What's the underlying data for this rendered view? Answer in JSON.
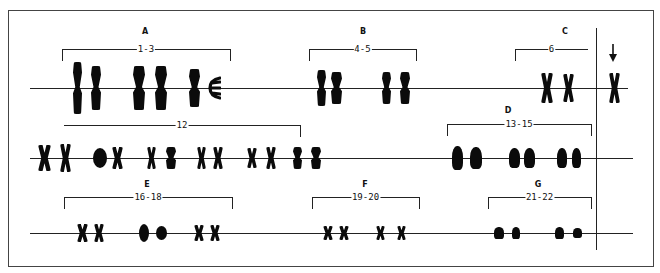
{
  "figure": {
    "type": "karyotype",
    "frame": {
      "left": 8,
      "top": 10,
      "right": 654,
      "bottom": 267
    },
    "divider": {
      "x": 596,
      "y1": 28,
      "y2": 250
    },
    "rows": [
      {
        "id": "row-1",
        "y": 88,
        "x1": 30,
        "x2": 628
      },
      {
        "id": "row-2",
        "y": 158,
        "x1": 30,
        "x2": 633
      },
      {
        "id": "row-3",
        "y": 233,
        "x1": 30,
        "x2": 633
      }
    ],
    "groups": [
      {
        "id": "A",
        "letter": "A",
        "range": "1-3",
        "letter_x": 145,
        "letter_y": 27,
        "bracket": {
          "x1": 62,
          "x2": 230,
          "y": 49,
          "tick": 12,
          "open": "both-down"
        },
        "row": 0,
        "chromosomes": [
          {
            "x": 73,
            "w": 9,
            "h": 52,
            "shape": "long"
          },
          {
            "x": 91,
            "w": 10,
            "h": 44,
            "shape": "long"
          },
          {
            "x": 133,
            "w": 12,
            "h": 44,
            "shape": "long"
          },
          {
            "x": 155,
            "w": 12,
            "h": 44,
            "shape": "long"
          },
          {
            "x": 189,
            "w": 11,
            "h": 38,
            "shape": "long"
          },
          {
            "x": 207,
            "w": 14,
            "h": 28,
            "shape": "fork"
          }
        ]
      },
      {
        "id": "B",
        "letter": "B",
        "range": "4-5",
        "letter_x": 363,
        "letter_y": 27,
        "bracket": {
          "x1": 309,
          "x2": 416,
          "y": 49,
          "tick": 12,
          "open": "both-down"
        },
        "row": 0,
        "chromosomes": [
          {
            "x": 317,
            "w": 9,
            "h": 36,
            "shape": "long"
          },
          {
            "x": 331,
            "w": 11,
            "h": 32,
            "shape": "long"
          },
          {
            "x": 382,
            "w": 9,
            "h": 32,
            "shape": "long"
          },
          {
            "x": 400,
            "w": 10,
            "h": 32,
            "shape": "long"
          }
        ]
      },
      {
        "id": "C",
        "letter": "C",
        "range": "6",
        "letter_x": 565,
        "letter_y": 27,
        "bracket": {
          "x1": 515,
          "x2": 588,
          "y": 49,
          "tick": 12,
          "open": "left-down"
        },
        "row": 0,
        "chromosomes": [
          {
            "x": 541,
            "w": 12,
            "h": 30,
            "shape": "x"
          },
          {
            "x": 563,
            "w": 11,
            "h": 28,
            "shape": "x"
          }
        ],
        "extra_row_2": [
          {
            "x": 38,
            "w": 13,
            "h": 26,
            "shape": "x"
          },
          {
            "x": 60,
            "w": 11,
            "h": 28,
            "shape": "x"
          },
          {
            "x": 93,
            "w": 14,
            "h": 20,
            "shape": "blob"
          },
          {
            "x": 112,
            "w": 11,
            "h": 22,
            "shape": "x"
          },
          {
            "x": 147,
            "w": 9,
            "h": 22,
            "shape": "x"
          },
          {
            "x": 166,
            "w": 10,
            "h": 22,
            "shape": "long"
          },
          {
            "x": 197,
            "w": 9,
            "h": 22,
            "shape": "x"
          },
          {
            "x": 213,
            "w": 10,
            "h": 22,
            "shape": "x"
          },
          {
            "x": 247,
            "w": 10,
            "h": 20,
            "shape": "x"
          },
          {
            "x": 266,
            "w": 10,
            "h": 22,
            "shape": "x"
          },
          {
            "x": 293,
            "w": 9,
            "h": 22,
            "shape": "long"
          },
          {
            "x": 311,
            "w": 10,
            "h": 22,
            "shape": "long"
          }
        ],
        "row2_bracket": {
          "x1": 64,
          "x2": 300,
          "y": 125,
          "label": "12",
          "open": "right-down"
        }
      },
      {
        "id": "D",
        "letter": "D",
        "range": "13-15",
        "letter_x": 508,
        "letter_y": 106,
        "bracket": {
          "x1": 447,
          "x2": 591,
          "y": 124,
          "tick": 12,
          "open": "both-down"
        },
        "row": 1,
        "chromosomes": [
          {
            "x": 452,
            "w": 11,
            "h": 24,
            "shape": "acro"
          },
          {
            "x": 470,
            "w": 12,
            "h": 22,
            "shape": "acro"
          },
          {
            "x": 509,
            "w": 11,
            "h": 20,
            "shape": "acro"
          },
          {
            "x": 524,
            "w": 11,
            "h": 20,
            "shape": "acro"
          },
          {
            "x": 557,
            "w": 10,
            "h": 20,
            "shape": "acro"
          },
          {
            "x": 572,
            "w": 9,
            "h": 20,
            "shape": "acro"
          }
        ]
      },
      {
        "id": "E",
        "letter": "E",
        "range": "16-18",
        "letter_x": 147,
        "letter_y": 180,
        "bracket": {
          "x1": 64,
          "x2": 232,
          "y": 197,
          "tick": 12,
          "open": "both-down"
        },
        "row": 2,
        "chromosomes": [
          {
            "x": 77,
            "w": 11,
            "h": 18,
            "shape": "x"
          },
          {
            "x": 94,
            "w": 10,
            "h": 18,
            "shape": "x"
          },
          {
            "x": 139,
            "w": 10,
            "h": 18,
            "shape": "blob"
          },
          {
            "x": 156,
            "w": 11,
            "h": 14,
            "shape": "blob"
          },
          {
            "x": 194,
            "w": 10,
            "h": 16,
            "shape": "x"
          },
          {
            "x": 210,
            "w": 10,
            "h": 16,
            "shape": "x"
          }
        ]
      },
      {
        "id": "F",
        "letter": "F",
        "range": "19-20",
        "letter_x": 365,
        "letter_y": 180,
        "bracket": {
          "x1": 312,
          "x2": 419,
          "y": 197,
          "tick": 12,
          "open": "both-down"
        },
        "row": 2,
        "chromosomes": [
          {
            "x": 323,
            "w": 10,
            "h": 14,
            "shape": "x"
          },
          {
            "x": 339,
            "w": 10,
            "h": 14,
            "shape": "x"
          },
          {
            "x": 376,
            "w": 9,
            "h": 14,
            "shape": "x"
          },
          {
            "x": 397,
            "w": 9,
            "h": 14,
            "shape": "x"
          }
        ]
      },
      {
        "id": "G",
        "letter": "G",
        "range": "21-22",
        "letter_x": 538,
        "letter_y": 180,
        "bracket": {
          "x1": 488,
          "x2": 591,
          "y": 197,
          "tick": 12,
          "open": "both-down"
        },
        "row": 2,
        "chromosomes": [
          {
            "x": 494,
            "w": 10,
            "h": 12,
            "shape": "acro"
          },
          {
            "x": 512,
            "w": 8,
            "h": 12,
            "shape": "acro"
          },
          {
            "x": 555,
            "w": 9,
            "h": 12,
            "shape": "acro"
          },
          {
            "x": 573,
            "w": 9,
            "h": 10,
            "shape": "acro"
          }
        ]
      }
    ],
    "sex_chromosome": {
      "label": "arrow",
      "x": 609,
      "y_top": 62,
      "w": 11,
      "h": 30,
      "shape": "x",
      "arrow": {
        "x": 613,
        "y1": 44,
        "y2": 62
      }
    }
  }
}
